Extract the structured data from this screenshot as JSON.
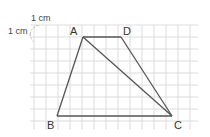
{
  "figure": {
    "type": "trapezoid on grid",
    "unit_label_top": "1 cm",
    "unit_label_left": "1 cm",
    "grid_cell_cm": 1,
    "vertices": {
      "A": {
        "label": "A",
        "grid": [
          4,
          1
        ]
      },
      "D": {
        "label": "D",
        "grid": [
          7,
          1
        ]
      },
      "B": {
        "label": "B",
        "grid": [
          2,
          7
        ]
      },
      "C": {
        "label": "C",
        "grid": [
          11,
          7
        ]
      }
    },
    "segments": [
      "AD",
      "AB",
      "BC",
      "CD",
      "AC"
    ],
    "colors": {
      "grid": "#d8d8d8",
      "lines": "#555555",
      "text": "#333333"
    }
  }
}
